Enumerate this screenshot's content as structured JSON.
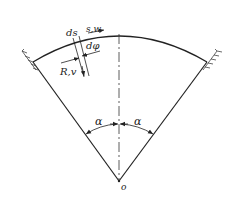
{
  "diagram": {
    "type": "circular-arch-sector",
    "labels": {
      "ds": "ds",
      "sw": "s,w",
      "dphi": "dφ",
      "Rv": "R,v",
      "alpha_left": "α",
      "alpha_right": "α",
      "origin": "o"
    },
    "colors": {
      "line": "#222222",
      "background": "#ffffff"
    }
  }
}
